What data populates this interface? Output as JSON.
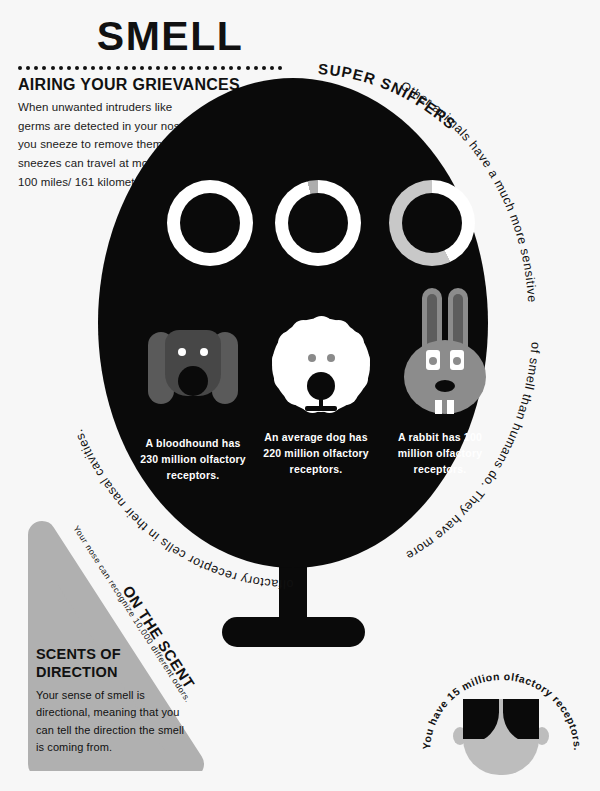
{
  "title": "SMELL",
  "sections": {
    "grievances": {
      "heading": "AIRING YOUR GRIEVANCES",
      "body": "When unwanted intruders like germs are detected in your nose, you sneeze to remove them. Your sneezes can travel at more than 100 miles/ 161 kilometers per hour."
    },
    "super_sniffers": {
      "heading": "SUPER SNIFFERS",
      "curved_body_1": "Other animals have a much more sensitive sense",
      "curved_body_2": "of smell than humans do. They have more",
      "curved_body_3": "olfactory receptor cells in their nasal cavities.",
      "full_body": "Other animals have a much more sensitive sense of smell than humans do. They have more olfactory receptor cells in their nasal cavities."
    },
    "on_the_scent": {
      "heading": "ON THE SCENT",
      "body": "Your nose can recognize 10,000 different odors."
    },
    "scents_of_direction": {
      "heading_line1": "SCENTS OF",
      "heading_line2": "DIRECTION",
      "body": "Your sense of smell is directional, meaning that you can tell the direction the smell is coming from."
    },
    "human": {
      "caption": "You have 15 million olfactory receptors."
    }
  },
  "animals": [
    {
      "name": "bloodhound",
      "caption": "A bloodhound has 230 million olfactory receptors.",
      "receptors_million": 230,
      "ring_fill_pct": 100,
      "ring_color": "#ffffff",
      "ring_track": "#ffffff",
      "face_color": "#474747"
    },
    {
      "name": "average-dog",
      "caption": "An average dog has 220 million olfactory receptors.",
      "receptors_million": 220,
      "ring_fill_pct": 96,
      "ring_color": "#ffffff",
      "ring_track": "#adadad",
      "face_color": "#ffffff"
    },
    {
      "name": "rabbit",
      "caption": "A rabbit has 100 million olfactory receptors.",
      "receptors_million": 100,
      "ring_fill_pct": 43,
      "ring_color": "#ffffff",
      "ring_track": "#c8c8c8",
      "face_color": "#8c8c8c"
    }
  ],
  "chart_data": {
    "type": "pie",
    "categories": [
      "A bloodhound",
      "An average dog",
      "A rabbit"
    ],
    "values": [
      230,
      220,
      100
    ],
    "unit": "million olfactory receptors",
    "ylabel": "",
    "xlabel": "",
    "legend": "none"
  },
  "colors": {
    "background": "#f7f7f7",
    "ink": "#111111",
    "black_shape": "#0a0a0a",
    "gray_triangle": "#b0b0b0",
    "light_gray": "#bdbdbd",
    "mid_gray": "#8c8c8c",
    "dark_gray": "#474747",
    "white": "#ffffff"
  },
  "dots_count": 33
}
